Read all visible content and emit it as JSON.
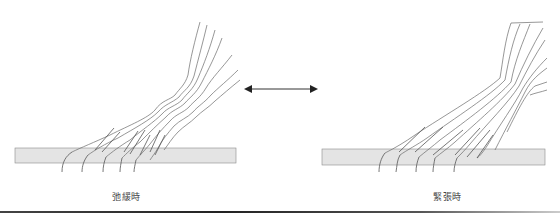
{
  "diagram": {
    "panels": [
      {
        "id": "relaxed",
        "label": "弛緩時"
      },
      {
        "id": "tense",
        "label": "緊張時"
      }
    ],
    "arrow": {
      "type": "bidirectional",
      "color": "#333333"
    },
    "band_color": "#e4e4e4",
    "band_border_color": "#8a8a8a",
    "fiber_color": "#6a6a6a"
  }
}
